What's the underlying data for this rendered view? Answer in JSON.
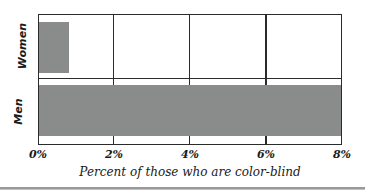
{
  "chart_data": {
    "type": "bar",
    "orientation": "horizontal",
    "title": "",
    "xlabel": "Percent of those who are color-blind",
    "ylabel": "",
    "categories": [
      "Women",
      "Men"
    ],
    "values": [
      0.8,
      8.0
    ],
    "value_unit": "%",
    "xlim": [
      0,
      8
    ],
    "ylim": null,
    "xticks": [
      0,
      2,
      4,
      6
    ],
    "xticklabels": [
      "0%",
      "2%",
      "4%",
      "6%",
      "8%"
    ],
    "xtick_values": [
      0,
      2,
      4,
      6,
      8
    ],
    "grid": "vertical-major",
    "legend": null,
    "series": [
      {
        "name": "Percent color-blind",
        "values": [
          0.8,
          8.0
        ],
        "color": "#8a8c8c"
      }
    ],
    "annotations": []
  },
  "chart": {
    "bar_color": "#8a8c8c",
    "axis_color": "#2b2b2b",
    "background": "#ffffff",
    "categories": [
      {
        "label": "Women",
        "value": 0.8
      },
      {
        "label": "Men",
        "value": 8.0
      }
    ],
    "xticks": [
      {
        "label": "0%",
        "value": 0
      },
      {
        "label": "2%",
        "value": 2
      },
      {
        "label": "4%",
        "value": 4
      },
      {
        "label": "6%",
        "value": 6
      },
      {
        "label": "8%",
        "value": 8
      }
    ],
    "axis_title": "Percent of those who are color-blind"
  }
}
